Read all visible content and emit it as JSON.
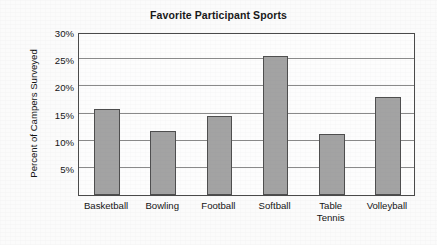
{
  "chart_data": {
    "type": "bar",
    "title": "Favorite Participant Sports",
    "xlabel": "",
    "ylabel": "Percent of Campers Surveyed",
    "categories": [
      "Basketball",
      "Bowling",
      "Football",
      "Softball",
      "Table Tennis",
      "Volleyball"
    ],
    "category_lines": [
      [
        "Basketball"
      ],
      [
        "Bowling"
      ],
      [
        "Football"
      ],
      [
        "Softball"
      ],
      [
        "Table",
        "Tennis"
      ],
      [
        "Volleyball"
      ]
    ],
    "values": [
      15.8,
      11.8,
      14.5,
      25.5,
      11.3,
      18.0
    ],
    "value_labels": [
      "15.8%",
      "11.8%",
      "14.5%",
      "25.5%",
      "11.3%",
      "18.0%"
    ],
    "ylim": [
      0,
      30
    ],
    "yticks": [
      5,
      10,
      15,
      20,
      25,
      30
    ],
    "ytick_labels": [
      "5%",
      "10%",
      "15%",
      "20%",
      "25%",
      "30%"
    ],
    "grid": true,
    "legend": false,
    "legend_position": "none",
    "bar_color": "#a3a3a3",
    "bar_edge_color": "#4e4e4e",
    "axis_color": "#4a4a4a",
    "gridline_color": "#8a8a8a",
    "background_color": "#fbfbfb",
    "plot_background_color": "#fdfdfd"
  }
}
